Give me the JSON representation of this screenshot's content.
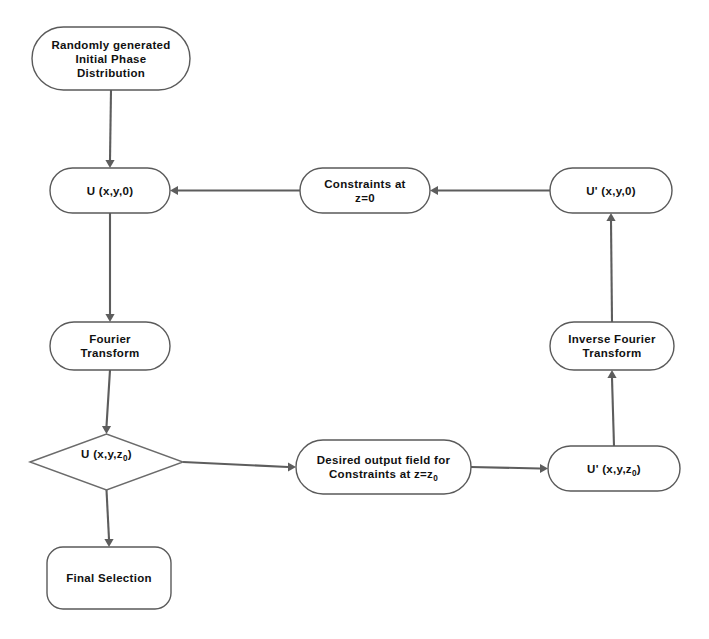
{
  "diagram": {
    "background_color": "#ffffff",
    "line_color": "#5d5d5d",
    "node_stroke_color": "#5a5a5a",
    "node_fill_color": "#ffffff",
    "text_color": "#111111",
    "nodes": [
      {
        "id": "initial-phase",
        "shape": "stadium",
        "x": 32,
        "y": 27,
        "w": 158,
        "h": 63,
        "lines": [
          "Randomly generated",
          "Initial Phase",
          "Distribution"
        ]
      },
      {
        "id": "u-xy0",
        "shape": "stadium",
        "x": 50,
        "y": 168,
        "w": 120,
        "h": 45,
        "lines": [
          "U (x,y,0)"
        ]
      },
      {
        "id": "constraints-z0",
        "shape": "stadium",
        "x": 300,
        "y": 168,
        "w": 130,
        "h": 45,
        "lines": [
          "Constraints at",
          "z=0"
        ]
      },
      {
        "id": "u-prime-xy0",
        "shape": "stadium",
        "x": 550,
        "y": 168,
        "w": 122,
        "h": 45,
        "lines": [
          "U' (x,y,0)"
        ]
      },
      {
        "id": "fourier-transform",
        "shape": "stadium",
        "x": 50,
        "y": 322,
        "w": 120,
        "h": 48,
        "lines": [
          "Fourier",
          "Transform"
        ]
      },
      {
        "id": "inverse-fourier-transform",
        "shape": "stadium",
        "x": 550,
        "y": 322,
        "w": 124,
        "h": 48,
        "lines": [
          "Inverse Fourier",
          "Transform"
        ]
      },
      {
        "id": "u-xyz0-decision",
        "shape": "diamond",
        "x": 30,
        "y": 434,
        "w": 153,
        "h": 56,
        "lines": [
          "U (x,y,z",
          "0",
          ")"
        ]
      },
      {
        "id": "desired-output-field",
        "shape": "stadium",
        "x": 296,
        "y": 440,
        "w": 175,
        "h": 54,
        "lines": [
          "Desired output field for",
          "Constraints at z=z",
          "0"
        ]
      },
      {
        "id": "u-prime-xyz0",
        "shape": "stadium",
        "x": 548,
        "y": 446,
        "w": 132,
        "h": 45,
        "lines": [
          "U' (x,y,z",
          "0",
          ")"
        ]
      },
      {
        "id": "final-selection",
        "shape": "rounded-rect",
        "x": 47,
        "y": 547,
        "w": 124,
        "h": 62,
        "lines": [
          "Final Selection"
        ]
      }
    ],
    "edges": [
      {
        "id": "edge-initial-to-u",
        "from": "initial-phase",
        "to": "u-xy0",
        "direction": "down"
      },
      {
        "id": "edge-u-to-fourier",
        "from": "u-xy0",
        "to": "fourier-transform",
        "direction": "down"
      },
      {
        "id": "edge-fourier-to-decision",
        "from": "fourier-transform",
        "to": "u-xyz0-decision",
        "direction": "down"
      },
      {
        "id": "edge-decision-to-final",
        "from": "u-xyz0-decision",
        "to": "final-selection",
        "direction": "down"
      },
      {
        "id": "edge-decision-to-desired",
        "from": "u-xyz0-decision",
        "to": "desired-output-field",
        "direction": "right"
      },
      {
        "id": "edge-desired-to-uprime-z0",
        "from": "desired-output-field",
        "to": "u-prime-xyz0",
        "direction": "right"
      },
      {
        "id": "edge-uprime-z0-to-inverse",
        "from": "u-prime-xyz0",
        "to": "inverse-fourier-transform",
        "direction": "up"
      },
      {
        "id": "edge-inverse-to-uprime-0",
        "from": "inverse-fourier-transform",
        "to": "u-prime-xy0",
        "direction": "up"
      },
      {
        "id": "edge-uprime-0-to-constraints",
        "from": "u-prime-xy0",
        "to": "constraints-z0",
        "direction": "left"
      },
      {
        "id": "edge-constraints-to-u",
        "from": "constraints-z0",
        "to": "u-xy0",
        "direction": "left"
      }
    ]
  }
}
